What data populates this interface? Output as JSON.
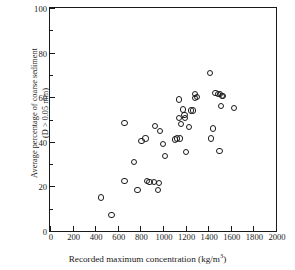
{
  "chart_data": {
    "type": "scatter",
    "title": "",
    "xlabel": "Recorded maximum concentration (kg/m³)",
    "xlabel_text": "Recorded maximum concentration (kg/m",
    "xlabel_sup": "3",
    "xlabel_tail": ")",
    "ylabel_line1": "Average percentage of coarse sediment",
    "ylabel_line2": "(D > 0.05 mm)",
    "xlim": [
      0,
      2000
    ],
    "ylim": [
      0,
      100
    ],
    "grid": false,
    "legend": "none",
    "xticks": [
      0,
      200,
      400,
      600,
      800,
      1000,
      1200,
      1400,
      1600,
      1800,
      2000
    ],
    "xtick_labels": [
      "0",
      "200",
      "400",
      "600",
      "800",
      "1000",
      "1200",
      "1400",
      "1600",
      "1800",
      "2000"
    ],
    "yticks": [
      0,
      20,
      40,
      60,
      80,
      100
    ],
    "ytick_labels": [
      "0",
      "20",
      "40",
      "60",
      "80",
      "100"
    ],
    "yticks_minor": [
      10,
      30,
      50,
      70,
      90
    ],
    "marker": "open-circle",
    "marker_color": "#1a1a1a",
    "n_points": 45,
    "points": [
      {
        "x": 450,
        "y": 15
      },
      {
        "x": 545,
        "y": 7
      },
      {
        "x": 660,
        "y": 48.5
      },
      {
        "x": 660,
        "y": 22.5
      },
      {
        "x": 740,
        "y": 31
      },
      {
        "x": 775,
        "y": 18.5
      },
      {
        "x": 810,
        "y": 40.5
      },
      {
        "x": 845,
        "y": 41.5
      },
      {
        "x": 855,
        "y": 22.5
      },
      {
        "x": 880,
        "y": 22
      },
      {
        "x": 920,
        "y": 22
      },
      {
        "x": 930,
        "y": 47
      },
      {
        "x": 955,
        "y": 18.5
      },
      {
        "x": 965,
        "y": 21.5
      },
      {
        "x": 975,
        "y": 45
      },
      {
        "x": 1000,
        "y": 39
      },
      {
        "x": 1020,
        "y": 33.5
      },
      {
        "x": 1105,
        "y": 41
      },
      {
        "x": 1125,
        "y": 41.5
      },
      {
        "x": 1140,
        "y": 59
      },
      {
        "x": 1145,
        "y": 50.5
      },
      {
        "x": 1150,
        "y": 41.5
      },
      {
        "x": 1160,
        "y": 48
      },
      {
        "x": 1180,
        "y": 54.5
      },
      {
        "x": 1190,
        "y": 52
      },
      {
        "x": 1195,
        "y": 50.5
      },
      {
        "x": 1200,
        "y": 35.5
      },
      {
        "x": 1230,
        "y": 46.5
      },
      {
        "x": 1245,
        "y": 54
      },
      {
        "x": 1265,
        "y": 54
      },
      {
        "x": 1280,
        "y": 61.5
      },
      {
        "x": 1285,
        "y": 59.5
      },
      {
        "x": 1300,
        "y": 60
      },
      {
        "x": 1415,
        "y": 71
      },
      {
        "x": 1425,
        "y": 41.5
      },
      {
        "x": 1440,
        "y": 46
      },
      {
        "x": 1465,
        "y": 62
      },
      {
        "x": 1490,
        "y": 61.5
      },
      {
        "x": 1500,
        "y": 36
      },
      {
        "x": 1505,
        "y": 61.5
      },
      {
        "x": 1510,
        "y": 56
      },
      {
        "x": 1520,
        "y": 60.5
      },
      {
        "x": 1530,
        "y": 60.5
      },
      {
        "x": 1625,
        "y": 55
      }
    ]
  }
}
